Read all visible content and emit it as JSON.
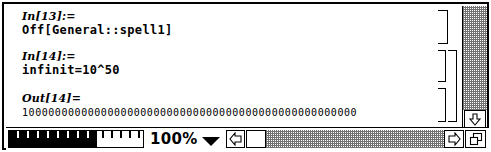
{
  "window": {
    "type": "mathematica-notebook",
    "colors": {
      "foreground": "#000000",
      "background": "#ffffff",
      "scrollbar_track": "#808080"
    }
  },
  "notebook": {
    "cells": [
      {
        "id": "cell-in-13",
        "label": "In[13]:=",
        "content": "Off[General::spell1]",
        "kind": "input",
        "grouped": false
      },
      {
        "id": "cell-in-14",
        "label": "In[14]:=",
        "content": "infinit=10^50",
        "kind": "input",
        "grouped": true
      },
      {
        "id": "cell-out-14",
        "label": "Out[14]=",
        "content": "100000000000000000000000000000000000000000000000000",
        "kind": "output",
        "grouped": true
      }
    ]
  },
  "bottom_bar": {
    "magnification_slider": {
      "name": "magnification-slider",
      "filled_ticks": 9,
      "empty_ticks": 5
    },
    "zoom_value": "100%",
    "zoom_dropdown_icon": "chevron-down-icon",
    "scroll_left_icon": "arrow-left-icon",
    "scroll_right_icon": "arrow-right-icon",
    "resize_icon": "resize-grow-icon"
  },
  "vertical_scrollbar": {
    "scroll_down_icon": "arrow-down-icon"
  }
}
